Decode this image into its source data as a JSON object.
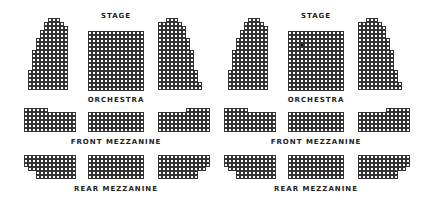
{
  "colors": {
    "seat_border": "#333333",
    "seat_empty": "#ffffff",
    "seat_selected": "#111111",
    "label": "#222222"
  },
  "labels": {
    "stage": "Stage",
    "orchestra": "Orchestra",
    "front_mezzanine": "Front Mezzanine",
    "rear_mezzanine": "Rear Mezzanine"
  },
  "charts": [
    {
      "name": "seating-chart-left",
      "selected_seat": null
    },
    {
      "name": "seating-chart-right",
      "selected_seat": {
        "section": "orchestra-center",
        "row": 3,
        "col": 3
      }
    }
  ],
  "sections": {
    "orchestra-left": {
      "x": 28,
      "y": 18,
      "rows": [
        [
          5,
          3
        ],
        [
          4,
          5
        ],
        [
          4,
          6
        ],
        [
          3,
          7
        ],
        [
          3,
          7
        ],
        [
          2,
          8
        ],
        [
          2,
          8
        ],
        [
          2,
          8
        ],
        [
          1,
          9
        ],
        [
          1,
          9
        ],
        [
          1,
          9
        ],
        [
          1,
          9
        ],
        [
          1,
          9
        ],
        [
          0,
          10
        ],
        [
          0,
          10
        ],
        [
          0,
          10
        ],
        [
          0,
          10
        ],
        [
          0,
          10
        ]
      ]
    },
    "orchestra-center": {
      "x": 88,
      "y": 31,
      "rows": "grid",
      "cols": 14,
      "nrows": 15
    },
    "orchestra-right": {
      "x": 158,
      "y": 18,
      "rows": [
        [
          2,
          3
        ],
        [
          0,
          6
        ],
        [
          0,
          7
        ],
        [
          0,
          7
        ],
        [
          0,
          7
        ],
        [
          0,
          8
        ],
        [
          0,
          8
        ],
        [
          0,
          8
        ],
        [
          0,
          9
        ],
        [
          0,
          9
        ],
        [
          0,
          9
        ],
        [
          0,
          9
        ],
        [
          0,
          9
        ],
        [
          0,
          10
        ],
        [
          0,
          10
        ],
        [
          0,
          10
        ],
        [
          0,
          11
        ],
        [
          0,
          11
        ]
      ]
    },
    "front-mezz-left": {
      "x": 24,
      "y": 108,
      "rows": [
        [
          0,
          6
        ],
        [
          0,
          13
        ],
        [
          0,
          13
        ],
        [
          0,
          13
        ],
        [
          0,
          13
        ],
        [
          0,
          13
        ]
      ]
    },
    "front-mezz-center": {
      "x": 88,
      "y": 112,
      "rows": "grid",
      "cols": 14,
      "nrows": 5
    },
    "front-mezz-right": {
      "x": 158,
      "y": 108,
      "rows": [
        [
          7,
          6
        ],
        [
          0,
          13
        ],
        [
          0,
          13
        ],
        [
          0,
          13
        ],
        [
          0,
          13
        ],
        [
          0,
          13
        ]
      ]
    },
    "rear-mezz-left": {
      "x": 24,
      "y": 155,
      "rows": [
        [
          0,
          13
        ],
        [
          0,
          13
        ],
        [
          0,
          13
        ],
        [
          1,
          12
        ],
        [
          3,
          10
        ],
        [
          3,
          10
        ]
      ]
    },
    "rear-mezz-center": {
      "x": 88,
      "y": 155,
      "rows": "grid",
      "cols": 14,
      "nrows": 6
    },
    "rear-mezz-right": {
      "x": 158,
      "y": 155,
      "rows": [
        [
          0,
          13
        ],
        [
          0,
          13
        ],
        [
          0,
          13
        ],
        [
          0,
          12
        ],
        [
          0,
          10
        ],
        [
          0,
          10
        ]
      ]
    }
  }
}
